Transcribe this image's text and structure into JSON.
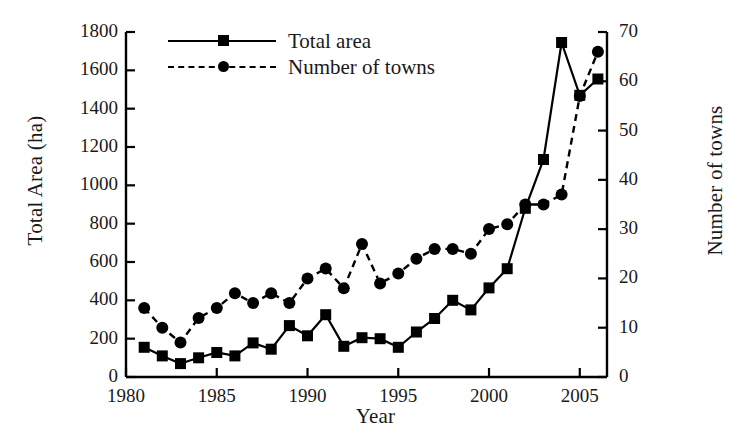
{
  "chart_data": {
    "type": "line",
    "title": "",
    "xlabel": "Year",
    "ylabel": "Total Area (ha)",
    "ylabel_right": "Number of towns",
    "x": [
      1981,
      1982,
      1983,
      1984,
      1985,
      1986,
      1987,
      1988,
      1989,
      1990,
      1991,
      1992,
      1993,
      1994,
      1995,
      1996,
      1997,
      1998,
      1999,
      2000,
      2001,
      2002,
      2003,
      2004,
      2005,
      2006
    ],
    "xlim": [
      1980,
      2006.5
    ],
    "ylim": [
      0,
      1800
    ],
    "ylim_right": [
      0,
      70
    ],
    "grid": false,
    "legend_position": "top-left",
    "xticks": [
      1980,
      1985,
      1990,
      1995,
      2000,
      2005
    ],
    "xtick_labels": [
      "1980",
      "1985",
      "1990",
      "1995",
      "2000",
      "2005"
    ],
    "yticks": [
      0,
      200,
      400,
      600,
      800,
      1000,
      1200,
      1400,
      1600,
      1800
    ],
    "ytick_labels": [
      "0",
      "200",
      "400",
      "600",
      "800",
      "1000",
      "1200",
      "1400",
      "1600",
      "1800"
    ],
    "yticks_right": [
      0,
      10,
      20,
      30,
      40,
      50,
      60,
      70
    ],
    "ytick_labels_right": [
      "0",
      "10",
      "20",
      "30",
      "40",
      "50",
      "60",
      "70"
    ],
    "series": [
      {
        "name": "Total area",
        "axis": "left",
        "marker": "square",
        "linestyle": "solid",
        "color": "#000000",
        "values": [
          155,
          110,
          70,
          100,
          128,
          110,
          178,
          145,
          268,
          215,
          325,
          160,
          205,
          200,
          155,
          235,
          305,
          400,
          350,
          465,
          565,
          880,
          1135,
          1745,
          1470,
          1555
        ]
      },
      {
        "name": "Number of towns",
        "axis": "right",
        "marker": "circle",
        "linestyle": "dashed",
        "color": "#000000",
        "values": [
          14,
          10,
          7,
          12,
          14,
          17,
          15,
          17,
          15,
          20,
          22,
          18,
          27,
          19,
          21,
          24,
          26,
          26,
          25,
          30,
          31,
          35,
          35,
          37,
          57,
          66
        ]
      }
    ]
  },
  "legend": {
    "entries": [
      {
        "label": "Total area"
      },
      {
        "label": "Number of towns"
      }
    ]
  }
}
